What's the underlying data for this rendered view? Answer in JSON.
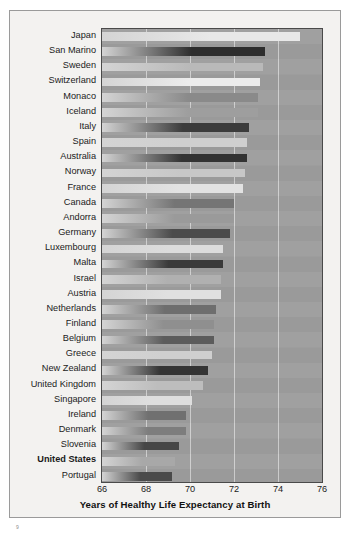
{
  "figure": {
    "page_mark": "9"
  },
  "chart_data": {
    "type": "bar",
    "orientation": "horizontal",
    "title": "",
    "xlabel": "Years of Healthy Life Expectancy at Birth",
    "ylabel": "",
    "xlim": [
      66,
      76
    ],
    "xticks": [
      66,
      68,
      70,
      72,
      74,
      76
    ],
    "xtick_labels": [
      "66",
      "68",
      "70",
      "72",
      "74",
      "76"
    ],
    "grid": true,
    "grid_axis": "x",
    "legend": "none",
    "plot_background": "#9d9d9d",
    "categories": [
      "Japan",
      "San Marino",
      "Sweden",
      "Switzerland",
      "Monaco",
      "Iceland",
      "Italy",
      "Spain",
      "Australia",
      "Norway",
      "France",
      "Canada",
      "Andorra",
      "Germany",
      "Luxembourg",
      "Malta",
      "Israel",
      "Austria",
      "Netherlands",
      "Finland",
      "Belgium",
      "Greece",
      "New Zealand",
      "United Kingdom",
      "Singapore",
      "Ireland",
      "Denmark",
      "Slovenia",
      "United States",
      "Portugal"
    ],
    "values": [
      75.0,
      73.4,
      73.3,
      73.2,
      73.1,
      73.1,
      72.7,
      72.6,
      72.6,
      72.5,
      72.4,
      72.0,
      72.0,
      71.8,
      71.5,
      71.5,
      71.4,
      71.4,
      71.2,
      71.1,
      71.1,
      71.0,
      70.8,
      70.6,
      70.1,
      69.8,
      69.8,
      69.5,
      69.3,
      69.2
    ],
    "bar_shades": [
      "#e8e8e8",
      "#2d2d2d",
      "#b9b9b9",
      "#ececec",
      "#8a8a8a",
      "#9e9e9e",
      "#3c3c3c",
      "#cfcfcf",
      "#333333",
      "#c7c7c7",
      "#e2e2e2",
      "#757575",
      "#9a9a9a",
      "#4b4b4b",
      "#dcdcdc",
      "#3a3a3a",
      "#b0b0b0",
      "#e0e0e0",
      "#6e6e6e",
      "#8f8f8f",
      "#5c5c5c",
      "#cfcfcf",
      "#343434",
      "#bdbdbd",
      "#dedede",
      "#707070",
      "#7d7d7d",
      "#464646",
      "#a8a8a8",
      "#4a4a4a"
    ],
    "highlighted_category": "United States"
  }
}
